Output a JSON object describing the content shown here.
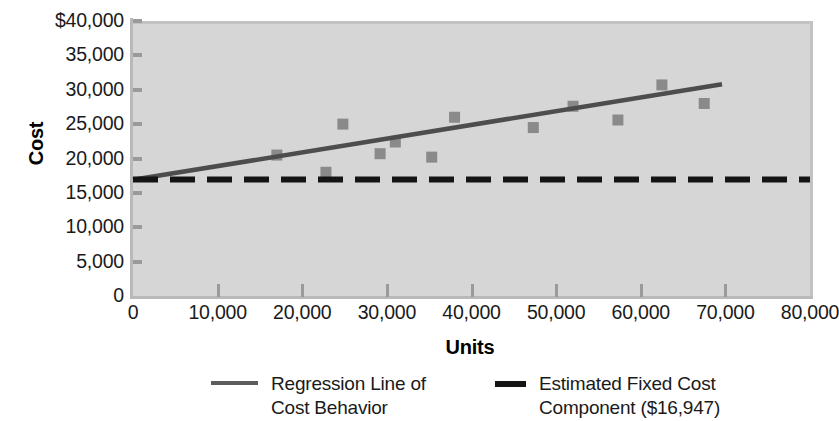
{
  "chart_data": {
    "type": "scatter",
    "title": "",
    "xlabel": "Units",
    "ylabel": "Cost",
    "xlim": [
      0,
      80000
    ],
    "ylim": [
      0,
      40000
    ],
    "grid": false,
    "legend_position": "bottom",
    "x_ticks": [
      "0",
      "10,000",
      "20,000",
      "30,000",
      "40,000",
      "50,000",
      "60,000",
      "70,000",
      "80,000"
    ],
    "x_tick_values": [
      0,
      10000,
      20000,
      30000,
      40000,
      50000,
      60000,
      70000,
      80000
    ],
    "y_ticks": [
      "0",
      "5,000",
      "10,000",
      "15,000",
      "20,000",
      "25,000",
      "30,000",
      "35,000",
      "$40,000"
    ],
    "y_tick_values": [
      0,
      5000,
      10000,
      15000,
      20000,
      25000,
      30000,
      35000,
      40000
    ],
    "series": [
      {
        "name": "Observed Cost Points",
        "type": "scatter",
        "marker": "square",
        "color": "#8a8a8a",
        "points": [
          {
            "x": 17000,
            "y": 20500
          },
          {
            "x": 22800,
            "y": 18000
          },
          {
            "x": 24800,
            "y": 25000
          },
          {
            "x": 29200,
            "y": 20700
          },
          {
            "x": 31000,
            "y": 22400
          },
          {
            "x": 35300,
            "y": 20200
          },
          {
            "x": 38000,
            "y": 26000
          },
          {
            "x": 47300,
            "y": 24500
          },
          {
            "x": 52000,
            "y": 27600
          },
          {
            "x": 57300,
            "y": 25600
          },
          {
            "x": 62500,
            "y": 30700
          },
          {
            "x": 67500,
            "y": 28000
          }
        ]
      },
      {
        "name": "Regression Line of Cost Behavior",
        "type": "line",
        "style": "solid",
        "color": "#4d4d4d",
        "points": [
          {
            "x": 0,
            "y": 16900
          },
          {
            "x": 69600,
            "y": 30800
          }
        ]
      },
      {
        "name": "Estimated Fixed Cost Component ($16,947)",
        "type": "line",
        "style": "dashed",
        "color": "#141414",
        "value": 16947,
        "points": [
          {
            "x": 0,
            "y": 16947
          },
          {
            "x": 80000,
            "y": 16947
          }
        ]
      }
    ],
    "legend": [
      {
        "label": "Regression Line of\nCost Behavior",
        "style": "solid",
        "color": "#4d4d4d"
      },
      {
        "label": "Estimated Fixed Cost\nComponent ($16,947)",
        "style": "dashed-thick",
        "color": "#141414"
      }
    ],
    "colors": {
      "plot_background": "#d6d6d6",
      "page_background": "#ffffff",
      "marker": "#8a8a8a",
      "regression_line": "#4d4d4d",
      "fixed_cost_line": "#141414",
      "axis": "#b9b9b9",
      "text": "#1a1a1a"
    }
  }
}
